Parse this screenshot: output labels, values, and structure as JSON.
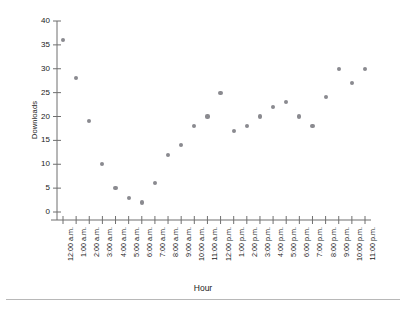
{
  "chart_data": {
    "type": "scatter",
    "title": "",
    "xlabel": "Hour",
    "ylabel": "Downloads",
    "ylim": [
      0,
      40
    ],
    "yticks": [
      0,
      5,
      10,
      15,
      20,
      25,
      30,
      35,
      40
    ],
    "grid": false,
    "legend": null,
    "marker_color": "#8a8a8f",
    "axis_color": "#6f6f6f",
    "categories": [
      "12:00 a.m.",
      "1:00 a.m.",
      "2:00 a.m.",
      "3:00 a.m.",
      "4:00 a.m.",
      "5:00 a.m.",
      "6:00 a.m.",
      "7:00 a.m.",
      "8:00 a.m.",
      "9:00 a.m.",
      "10:00 a.m.",
      "11:00 a.m.",
      "12:00 p.m.",
      "1:00 p.m.",
      "2:00 p.m.",
      "3:00 p.m.",
      "4:00 p.m.",
      "5:00 p.m.",
      "6:00 p.m.",
      "7:00 p.m.",
      "8:00 p.m.",
      "9:00 p.m.",
      "10:00 p.m.",
      "11:00 p.m."
    ],
    "values": [
      36,
      28,
      19,
      10,
      5,
      3,
      2,
      6,
      12,
      14,
      18,
      20,
      25,
      17,
      18,
      20,
      22,
      23,
      20,
      18,
      24,
      30,
      27,
      30
    ]
  }
}
